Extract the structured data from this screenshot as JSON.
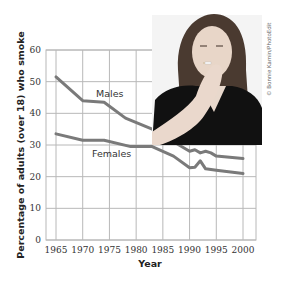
{
  "chart_data": {
    "type": "line",
    "title": "",
    "xlabel": "Year",
    "ylabel": "Percentage of adults (over 18) who smoke",
    "xlim": [
      1965,
      2000
    ],
    "ylim": [
      0,
      60
    ],
    "x_ticks": [
      1965,
      1970,
      1975,
      1980,
      1985,
      1990,
      1995,
      2000
    ],
    "y_ticks": [
      0,
      10,
      20,
      30,
      40,
      50,
      60
    ],
    "grid": true,
    "legend": "inline labels",
    "series": [
      {
        "name": "Males",
        "color": "#7a7a7a",
        "x": [
          1965,
          1970,
          1974,
          1978,
          1983,
          1987,
          1990,
          1991,
          1992,
          1993,
          1994,
          1995,
          2000
        ],
        "values": [
          51.5,
          44,
          43.5,
          38.5,
          35,
          31,
          28,
          28.5,
          27.5,
          28,
          27.5,
          26.5,
          25.7
        ]
      },
      {
        "name": "Females",
        "color": "#7a7a7a",
        "x": [
          1965,
          1970,
          1974,
          1979,
          1983,
          1987,
          1990,
          1991,
          1992,
          1993,
          1995,
          2000
        ],
        "values": [
          33.5,
          31.5,
          31.5,
          29.5,
          29.5,
          26.5,
          22.8,
          23,
          25,
          22.5,
          22,
          21
        ]
      }
    ],
    "annotations": [
      "Males",
      "Females"
    ]
  },
  "photo": {
    "description": "Photo of a woman smoking a cigarette",
    "credit": "© Bonnie Kamin/PhotoEdit"
  },
  "colors": {
    "line": "#7a7a7a",
    "grid": "#b8b8b8",
    "photo_dark": "#111111"
  }
}
